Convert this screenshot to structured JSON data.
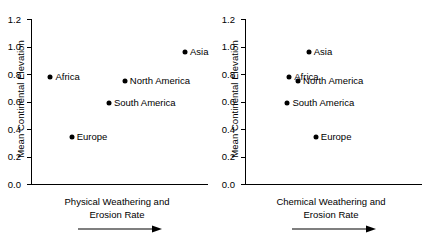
{
  "chart_data": [
    {
      "type": "scatter",
      "panel": "left",
      "title": "",
      "xlabel": "Physical Weathering and Erosion Rate",
      "xlabel_lines": [
        "Physical Weathering and",
        "Erosion Rate"
      ],
      "ylabel": "Mean Continental Elevation",
      "xaxis_arrow": "increasing-right",
      "xticks": [],
      "xlim": [
        0,
        1
      ],
      "ylim": [
        0.0,
        1.2
      ],
      "yticks": [
        0.0,
        0.2,
        0.4,
        0.6,
        0.8,
        1.0,
        1.2
      ],
      "ytick_labels": [
        "0.0",
        "0.2",
        "0.4",
        "0.6",
        "0.8",
        "1.0",
        "1.2"
      ],
      "grid": false,
      "legend": "none",
      "points": [
        {
          "label": "Africa",
          "x": 0.11,
          "y": 0.78
        },
        {
          "label": "Europe",
          "x": 0.23,
          "y": 0.34
        },
        {
          "label": "South America",
          "x": 0.44,
          "y": 0.59
        },
        {
          "label": "North America",
          "x": 0.53,
          "y": 0.75
        },
        {
          "label": "Asia",
          "x": 0.87,
          "y": 0.96
        }
      ]
    },
    {
      "type": "scatter",
      "panel": "right",
      "title": "",
      "xlabel": "Chemical Weathering and Erosion Rate",
      "xlabel_lines": [
        "Chemical Weathering and",
        "Erosion Rate"
      ],
      "ylabel": "Mean Continental Elevation",
      "xaxis_arrow": "increasing-right",
      "xticks": [],
      "xlim": [
        0,
        1
      ],
      "ylim": [
        0.0,
        1.2
      ],
      "yticks": [
        0.0,
        0.2,
        0.4,
        0.6,
        0.8,
        1.0,
        1.2
      ],
      "ytick_labels": [
        "0.0",
        "0.2",
        "0.4",
        "0.6",
        "0.8",
        "1.0",
        "1.2"
      ],
      "grid": false,
      "legend": "none",
      "points": [
        {
          "label": "Asia",
          "x": 0.36,
          "y": 0.96
        },
        {
          "label": "Africa",
          "x": 0.25,
          "y": 0.78
        },
        {
          "label": "North America",
          "x": 0.3,
          "y": 0.75
        },
        {
          "label": "South America",
          "x": 0.24,
          "y": 0.59
        },
        {
          "label": "Europe",
          "x": 0.4,
          "y": 0.34
        }
      ]
    }
  ]
}
